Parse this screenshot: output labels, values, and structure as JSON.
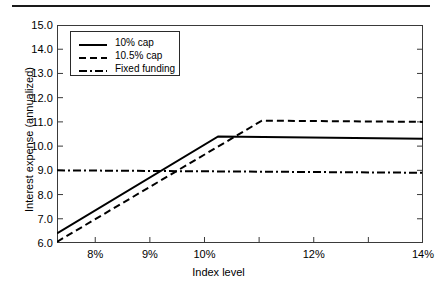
{
  "chart_data": {
    "type": "line",
    "title": "",
    "xlabel": "Index level",
    "ylabel": "Interest expense (annualized)",
    "xlim": [
      7.3,
      14.0
    ],
    "ylim": [
      6.0,
      15.0
    ],
    "grid": false,
    "legend_position": "upper-left",
    "x_ticks": [
      {
        "value": 8,
        "label": "8%"
      },
      {
        "value": 9,
        "label": "9%"
      },
      {
        "value": 10,
        "label": "10%"
      },
      {
        "value": 11,
        "label": ""
      },
      {
        "value": 12,
        "label": "12%"
      },
      {
        "value": 13,
        "label": ""
      },
      {
        "value": 14,
        "label": "14%"
      }
    ],
    "y_ticks": [
      {
        "value": 6.0,
        "label": "6.0"
      },
      {
        "value": 7.0,
        "label": "7.0"
      },
      {
        "value": 8.0,
        "label": "8.0"
      },
      {
        "value": 9.0,
        "label": "9.0"
      },
      {
        "value": 10.0,
        "label": "10.0"
      },
      {
        "value": 11.0,
        "label": "11.0"
      },
      {
        "value": 12.0,
        "label": "12.0"
      },
      {
        "value": 13.0,
        "label": "13.0"
      },
      {
        "value": 14.0,
        "label": "14.0"
      },
      {
        "value": 15.0,
        "label": "15.0"
      }
    ],
    "series": [
      {
        "name": "10% cap",
        "style": "solid",
        "color": "#000000",
        "x": [
          7.3,
          10.25,
          14.0
        ],
        "values": [
          6.4,
          10.4,
          10.3
        ]
      },
      {
        "name": "10.5% cap",
        "style": "dashed",
        "color": "#000000",
        "x": [
          7.3,
          11.05,
          14.0
        ],
        "values": [
          6.05,
          11.05,
          11.0
        ]
      },
      {
        "name": "Fixed funding",
        "style": "dash-dot",
        "color": "#000000",
        "x": [
          7.3,
          14.0
        ],
        "values": [
          9.0,
          8.9
        ]
      }
    ]
  },
  "legend": {
    "entries": [
      {
        "label": "10% cap",
        "style": "solid"
      },
      {
        "label": "10.5% cap",
        "style": "dashed"
      },
      {
        "label": "Fixed funding",
        "style": "dash-dot"
      }
    ]
  },
  "axes": {
    "x_title": "Index level",
    "y_title": "Interest expense (annualized)"
  }
}
